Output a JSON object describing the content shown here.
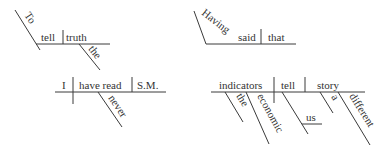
{
  "diagrams": [
    {
      "id": "to-tell-the-truth",
      "words": {
        "slant": "To",
        "verb": "tell",
        "object": "truth",
        "modifier": "the"
      }
    },
    {
      "id": "i-have-never-read-sm",
      "words": {
        "subject": "I",
        "verb": "have read",
        "object": "S.M.",
        "modifier": "never"
      }
    },
    {
      "id": "having-said-that",
      "words": {
        "slant": "Having",
        "verb": "said",
        "object": "that"
      }
    },
    {
      "id": "economic-indicators-tell-story",
      "words": {
        "subject": "indicators",
        "verb": "tell",
        "object": "story",
        "subject_mod_1": "the",
        "subject_mod_2": "economic",
        "indirect_object": "us",
        "object_mod_1": "a",
        "object_mod_2": "different"
      }
    }
  ],
  "colors": {
    "line": "#3a3a3a",
    "text": "#333333"
  }
}
